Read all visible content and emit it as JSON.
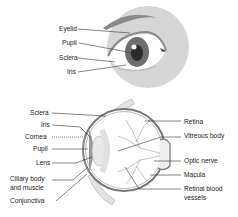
{
  "external_view": {
    "labels": [
      {
        "id": "eyelid",
        "text": "Eyelid"
      },
      {
        "id": "pupil",
        "text": "Pupil"
      },
      {
        "id": "sclera",
        "text": "Sclera"
      },
      {
        "id": "iris",
        "text": "Iris"
      }
    ]
  },
  "cross_section": {
    "left_labels": [
      {
        "id": "sclera",
        "text": "Sclera"
      },
      {
        "id": "iris",
        "text": "Iris"
      },
      {
        "id": "cornea",
        "text": "Cornea"
      },
      {
        "id": "pupil",
        "text": "Pupil"
      },
      {
        "id": "lens",
        "text": "Lens"
      },
      {
        "id": "ciliary",
        "text": "Ciliary body",
        "text2": "and muscle"
      },
      {
        "id": "conjunctiva",
        "text": "Conjunctiva"
      }
    ],
    "right_labels": [
      {
        "id": "retina",
        "text": "Retina"
      },
      {
        "id": "vitreous",
        "text": "Vitreous body"
      },
      {
        "id": "optic-nerve",
        "text": "Optic nerve"
      },
      {
        "id": "macula",
        "text": "Macula"
      },
      {
        "id": "retinal-vessels",
        "text": "Retinal blood",
        "text2": "vessels"
      }
    ]
  },
  "colors": {
    "circle_bg": "#d6d6d6",
    "iris": "#6e6e6e",
    "pupil": "#2c2c2c",
    "lines": "#333333"
  }
}
